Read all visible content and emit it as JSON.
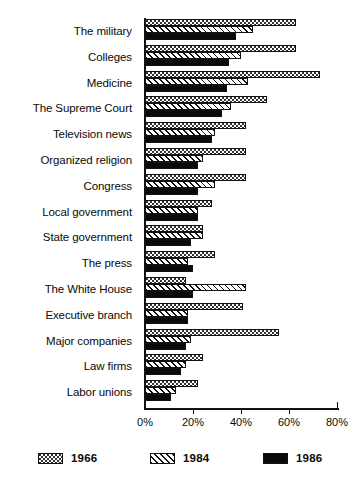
{
  "chart_data": {
    "type": "bar",
    "orientation": "horizontal",
    "title": "",
    "subtitle": "",
    "xlabel": "",
    "ylabel": "",
    "xlim": [
      0,
      80
    ],
    "grid": false,
    "legend_position": "bottom",
    "xtick_labels": [
      "0%",
      "20%",
      "40%",
      "60%",
      "80%"
    ],
    "xticks": [
      0,
      20,
      40,
      60,
      80
    ],
    "categories": [
      "The military",
      "Colleges",
      "Medicine",
      "The Supreme Court",
      "Television news",
      "Organized religion",
      "Congress",
      "Local government",
      "State government",
      "The press",
      "The White House",
      "Executive branch",
      "Major companies",
      "Law firms",
      "Labor unions"
    ],
    "series": [
      {
        "name": "1966",
        "pattern": "dotted",
        "values": [
          63,
          63,
          73,
          51,
          42,
          42,
          42,
          28,
          24,
          29,
          17,
          41,
          56,
          24,
          22
        ]
      },
      {
        "name": "1984",
        "pattern": "hatched",
        "values": [
          45,
          40,
          43,
          36,
          29,
          24,
          29,
          22,
          24,
          18,
          42,
          18,
          19,
          17,
          13
        ]
      },
      {
        "name": "1986",
        "pattern": "solid",
        "values": [
          38,
          35,
          34,
          32,
          28,
          22,
          22,
          22,
          19,
          20,
          20,
          18,
          17,
          15,
          11
        ]
      }
    ]
  },
  "legend": {
    "items": [
      {
        "label": "1966",
        "swatch": "dotted-swatch"
      },
      {
        "label": "1984",
        "swatch": "hatched-swatch"
      },
      {
        "label": "1986",
        "swatch": "solid-swatch"
      }
    ]
  },
  "colors": {
    "ink": "#0a0a0a",
    "background": "#ffffff"
  }
}
